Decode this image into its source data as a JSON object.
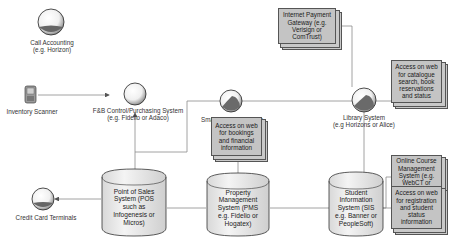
{
  "diagram": {
    "type": "system-integration-diagram",
    "nodes": {
      "call_accounting": {
        "shape": "circle",
        "label_line1": "Call Accounting",
        "label_line2": "(e.g. Horizon)"
      },
      "inventory_scanner": {
        "shape": "device",
        "label": "Inventory Scanner"
      },
      "fnb_control": {
        "shape": "circle",
        "label_line1": "F&B Control/Purchasing System",
        "label_line2": "(e.g. Fidelio or Adaco)"
      },
      "smart_id": {
        "shape": "circle",
        "label": "Smart ID-card System"
      },
      "library": {
        "shape": "circle",
        "label_line1": "Library System",
        "label_line2": "(e.g Horizons or Alice)"
      },
      "credit_card": {
        "shape": "circle",
        "label": "Credit Card Terminals"
      },
      "internet_payment": {
        "shape": "document",
        "lines": [
          "Internet Payment",
          "Gateway (e.g.",
          "Verisign or",
          "ComTrust)"
        ]
      },
      "library_web": {
        "shape": "document",
        "lines": [
          "Access on web",
          "for catalogue",
          "search, book",
          "reservations",
          "and status"
        ]
      },
      "pms_web": {
        "shape": "document",
        "lines": [
          "Access on web",
          "for bookings",
          "and financial",
          "information"
        ]
      },
      "online_course": {
        "shape": "document",
        "lines": [
          "Online Course",
          "Management",
          "System (e.g.",
          "WebCT or",
          "BlackBoard)"
        ]
      },
      "sis_web": {
        "shape": "document",
        "lines": [
          "Access on web",
          "for registration",
          "and student",
          "status",
          "information"
        ]
      },
      "pos": {
        "shape": "cylinder",
        "lines": [
          "Point of Sales",
          "System (POS",
          "such as",
          "Infogenesis or",
          "Micros)"
        ]
      },
      "pms": {
        "shape": "cylinder",
        "lines": [
          "Property",
          "Management",
          "System (PMS",
          "e.g. Fidelio or",
          "Hogatex)"
        ]
      },
      "sis": {
        "shape": "cylinder",
        "lines": [
          "Student",
          "Information",
          "System (SIS",
          "e.g. Banner or",
          "PeopleSoft)"
        ]
      }
    },
    "edges": [
      {
        "from": "inventory_scanner",
        "to": "fnb_control",
        "arrow": "to"
      },
      {
        "from": "pos",
        "to": "fnb_control",
        "arrow": "to"
      },
      {
        "from": "pos",
        "to": "credit_card",
        "arrow": "to"
      },
      {
        "from": "pos",
        "to": "pms",
        "arrow": "none"
      },
      {
        "from": "pms",
        "to": "sis",
        "arrow": "none"
      },
      {
        "from": "pms",
        "to": "pms_web",
        "arrow": "none"
      },
      {
        "from": "pos",
        "to": "smart_id",
        "arrow": "none"
      },
      {
        "from": "smart_id",
        "to": "library",
        "arrow": "none"
      },
      {
        "from": "library",
        "to": "internet_payment",
        "arrow": "none"
      },
      {
        "from": "library",
        "to": "library_web",
        "arrow": "none"
      },
      {
        "from": "library",
        "to": "sis",
        "arrow": "none"
      },
      {
        "from": "sis",
        "to": "online_course",
        "arrow": "none"
      },
      {
        "from": "sis",
        "to": "sis_web",
        "arrow": "none"
      }
    ],
    "colors": {
      "line": "#808080",
      "doc_fill": "#c4c4c4",
      "doc_border": "#555555",
      "sphere_light": "#ffffff",
      "sphere_dark": "#5a5a5a"
    }
  }
}
